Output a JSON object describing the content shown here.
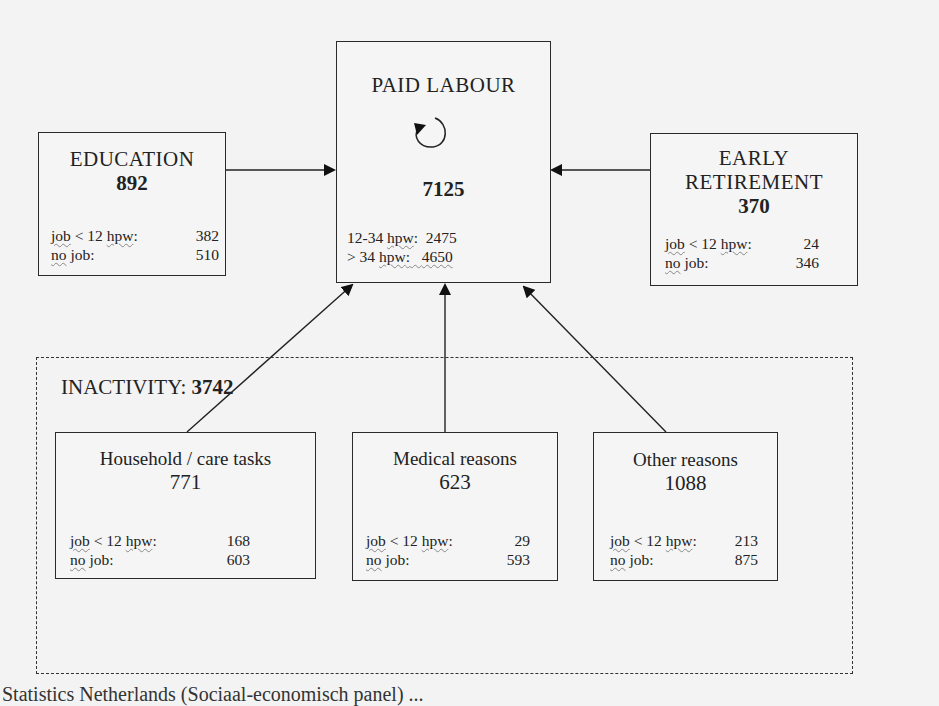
{
  "diagram": {
    "paid_labour": {
      "title": "PAID LABOUR",
      "total": "7125",
      "rows": [
        {
          "label_a": "12-34",
          "label_b": "hpw",
          "sep": ":",
          "value": "2475"
        },
        {
          "label_a": "> 34",
          "label_b": "hpw",
          "sep": ":",
          "value": "4650"
        }
      ],
      "self_loop_icon": "circular-arrow-icon"
    },
    "education": {
      "title": "EDUCATION",
      "total": "892",
      "rows": [
        {
          "label_a": "job",
          "label_mid": " < 12 ",
          "label_b": "hpw",
          "sep": ":",
          "value": "382"
        },
        {
          "label_a": "no",
          "label_mid": " job:",
          "value": "510"
        }
      ]
    },
    "early_retirement": {
      "title_line1": "EARLY",
      "title_line2": "RETIREMENT",
      "total": "370",
      "rows": [
        {
          "label_a": "job",
          "label_mid": " < 12 ",
          "label_b": "hpw",
          "sep": ":",
          "value": "24"
        },
        {
          "label_a": "no",
          "label_mid": " job:",
          "value": "346"
        }
      ]
    },
    "inactivity": {
      "label": "INACTIVITY:",
      "total": "3742",
      "household": {
        "title": "Household / care tasks",
        "total": "771",
        "rows": [
          {
            "label_a": "job",
            "label_mid": " < 12 ",
            "label_b": "hpw",
            "sep": ":",
            "value": "168"
          },
          {
            "label_a": "no",
            "label_mid": " job:",
            "value": "603"
          }
        ]
      },
      "medical": {
        "title": "Medical reasons",
        "total": "623",
        "rows": [
          {
            "label_a": "job",
            "label_mid": " < 12 ",
            "label_b": "hpw",
            "sep": ":",
            "value": "29"
          },
          {
            "label_a": "no",
            "label_mid": " job:",
            "value": "593"
          }
        ]
      },
      "other": {
        "title": "Other reasons",
        "total": "1088",
        "rows": [
          {
            "label_a": "job",
            "label_mid": " < 12 ",
            "label_b": "hpw",
            "sep": ":",
            "value": "213"
          },
          {
            "label_a": "no",
            "label_mid": " job:",
            "value": "875"
          }
        ]
      }
    },
    "flows": [
      {
        "from": "EDUCATION",
        "to": "PAID LABOUR"
      },
      {
        "from": "EARLY RETIREMENT",
        "to": "PAID LABOUR"
      },
      {
        "from": "Household / care tasks",
        "to": "PAID LABOUR"
      },
      {
        "from": "Medical reasons",
        "to": "PAID LABOUR"
      },
      {
        "from": "Other reasons",
        "to": "PAID LABOUR"
      },
      {
        "from": "PAID LABOUR",
        "to": "PAID LABOUR"
      }
    ],
    "caption": "Statistics Netherlands (Sociaal-economisch panel) ..."
  }
}
